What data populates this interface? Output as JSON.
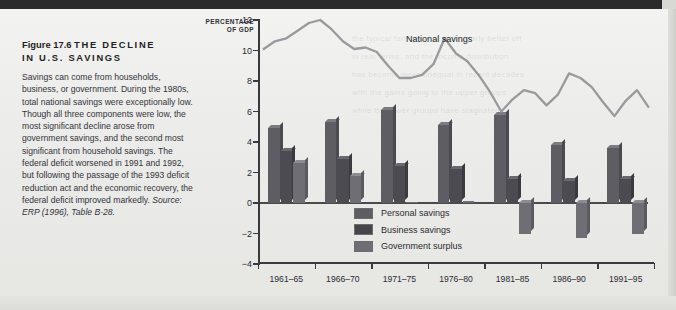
{
  "figure": {
    "label": "Figure 17.6",
    "title": "THE DECLINE IN U.S. SAVINGS",
    "title_line1": "THE  DECLINE",
    "title_line2": "IN  U.S.  SAVINGS",
    "body": "Savings can come from households, business, or government. During the 1980s, total national savings were exceptionally low. Though all three components were low, the most significant decline arose from government savings, and the second most significant from household savings. The federal deficit worsened in 1991 and 1992, but following the passage of the 1993 deficit reduction act and the economic recovery, the federal deficit improved markedly.",
    "source_prefix": "Source:",
    "source_italic": "ERP",
    "source_rest": "(1996), Table B-28."
  },
  "colors": {
    "personal": "#5d5d63",
    "business": "#4b4b51",
    "government": "#6e6e74",
    "line": "#9a9a9e",
    "axis": "#3a3a3e",
    "paper": "#ececea",
    "topbar": "#2b2b2b"
  },
  "chart_data": {
    "type": "bar",
    "title": "THE DECLINE IN U.S. SAVINGS",
    "xlabel": "",
    "ylabel": "PERCENTAGE OF GDP",
    "ylabel_line1": "PERCENTAGE",
    "ylabel_line2": "OF GDP",
    "ylim": [
      -4,
      12
    ],
    "yticks": [
      -4,
      -2,
      0,
      2,
      4,
      6,
      8,
      10,
      12
    ],
    "ytick_labels": [
      "−4",
      "−2",
      "0",
      "2",
      "4",
      "6",
      "8",
      "10",
      "12"
    ],
    "grid": false,
    "legend_position": "inside-bottom-left",
    "categories": [
      "1961–65",
      "1966–70",
      "1971–75",
      "1976–80",
      "1981–85",
      "1986–90",
      "1991–95"
    ],
    "series": [
      {
        "name": "Personal savings",
        "type": "bar",
        "values": [
          4.9,
          5.3,
          6.1,
          5.1,
          5.8,
          3.8,
          3.6
        ]
      },
      {
        "name": "Business savings",
        "type": "bar",
        "values": [
          3.4,
          2.9,
          2.4,
          2.2,
          1.6,
          1.45,
          1.6
        ]
      },
      {
        "name": "Government surplus",
        "type": "bar",
        "values": [
          2.6,
          1.8,
          0.05,
          0.1,
          -2.0,
          -2.3,
          -2.0
        ]
      },
      {
        "name": "National savings",
        "type": "line",
        "x": [
          1961,
          1962,
          1963,
          1964,
          1965,
          1966,
          1967,
          1968,
          1969,
          1970,
          1971,
          1972,
          1973,
          1974,
          1975,
          1976,
          1977,
          1978,
          1979,
          1980,
          1981,
          1982,
          1983,
          1984,
          1985,
          1986,
          1987,
          1988,
          1989,
          1990,
          1991,
          1992,
          1993,
          1994,
          1995
        ],
        "values": [
          10.1,
          10.6,
          10.8,
          11.3,
          11.8,
          12.0,
          11.4,
          10.6,
          10.1,
          10.2,
          9.9,
          9.0,
          8.2,
          8.2,
          8.4,
          9.1,
          10.8,
          9.8,
          9.3,
          8.4,
          7.3,
          6.0,
          6.8,
          7.4,
          7.2,
          6.4,
          7.1,
          8.5,
          8.2,
          7.6,
          6.6,
          5.7,
          6.7,
          7.4,
          6.3
        ]
      }
    ],
    "annotations": [
      {
        "text": "National savings",
        "x": 1972,
        "y": 10.6
      }
    ]
  },
  "legend": [
    {
      "label": "Personal savings",
      "color": "#5d5d63"
    },
    {
      "label": "Business savings",
      "color": "#45454b"
    },
    {
      "label": "Government surplus",
      "color": "#6e6e74"
    }
  ]
}
